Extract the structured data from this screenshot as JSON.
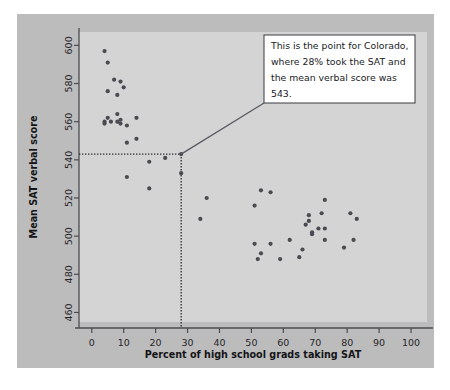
{
  "figure": {
    "background_color": "#bcbcbc",
    "plot_background_color": "#d4d4d4",
    "point_color": "#4a4a50",
    "axis_color": "#4c4c52",
    "callout_border_color": "#3a3a40",
    "callout_background_color": "#ffffff",
    "leader_line_color": "#5a5a62"
  },
  "annotation": {
    "line1": "This is the point for Colorado,",
    "line2": "where 28% took the SAT and",
    "line3": "the mean verbal score was",
    "line4": "543."
  },
  "chart_data": {
    "type": "scatter",
    "title": "",
    "xlabel": "Percent of high school grads taking SAT",
    "ylabel": "Mean SAT verbal score",
    "xlim": [
      -4,
      105
    ],
    "ylim": [
      455,
      607
    ],
    "xticks": [
      0,
      10,
      20,
      30,
      40,
      50,
      60,
      70,
      80,
      90,
      100
    ],
    "yticks": [
      460,
      480,
      500,
      520,
      540,
      560,
      580,
      600
    ],
    "grid": false,
    "legend": null,
    "highlight": {
      "label": "Colorado",
      "x": 28,
      "y": 543,
      "guide_lines": "dotted"
    },
    "points": [
      {
        "x": 4,
        "y": 597
      },
      {
        "x": 5,
        "y": 591
      },
      {
        "x": 7,
        "y": 582
      },
      {
        "x": 5,
        "y": 576
      },
      {
        "x": 9,
        "y": 581
      },
      {
        "x": 8,
        "y": 574
      },
      {
        "x": 10,
        "y": 578
      },
      {
        "x": 4,
        "y": 560
      },
      {
        "x": 4,
        "y": 559
      },
      {
        "x": 5,
        "y": 562
      },
      {
        "x": 6,
        "y": 560
      },
      {
        "x": 8,
        "y": 564
      },
      {
        "x": 8,
        "y": 560
      },
      {
        "x": 9,
        "y": 561
      },
      {
        "x": 9,
        "y": 559
      },
      {
        "x": 11,
        "y": 558
      },
      {
        "x": 14,
        "y": 562
      },
      {
        "x": 11,
        "y": 549
      },
      {
        "x": 14,
        "y": 551
      },
      {
        "x": 18,
        "y": 539
      },
      {
        "x": 23,
        "y": 541
      },
      {
        "x": 11,
        "y": 531
      },
      {
        "x": 18,
        "y": 525
      },
      {
        "x": 28,
        "y": 543
      },
      {
        "x": 28,
        "y": 533
      },
      {
        "x": 36,
        "y": 520
      },
      {
        "x": 34,
        "y": 509
      },
      {
        "x": 53,
        "y": 524
      },
      {
        "x": 56,
        "y": 523
      },
      {
        "x": 51,
        "y": 516
      },
      {
        "x": 51,
        "y": 496
      },
      {
        "x": 53,
        "y": 491
      },
      {
        "x": 52,
        "y": 488
      },
      {
        "x": 56,
        "y": 496
      },
      {
        "x": 59,
        "y": 488
      },
      {
        "x": 62,
        "y": 498
      },
      {
        "x": 65,
        "y": 489
      },
      {
        "x": 66,
        "y": 493
      },
      {
        "x": 67,
        "y": 506
      },
      {
        "x": 68,
        "y": 511
      },
      {
        "x": 68,
        "y": 508
      },
      {
        "x": 69,
        "y": 502
      },
      {
        "x": 69,
        "y": 501
      },
      {
        "x": 71,
        "y": 504
      },
      {
        "x": 72,
        "y": 512
      },
      {
        "x": 73,
        "y": 519
      },
      {
        "x": 73,
        "y": 504
      },
      {
        "x": 73,
        "y": 498
      },
      {
        "x": 79,
        "y": 494
      },
      {
        "x": 81,
        "y": 512
      },
      {
        "x": 82,
        "y": 498
      },
      {
        "x": 83,
        "y": 509
      }
    ]
  }
}
